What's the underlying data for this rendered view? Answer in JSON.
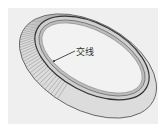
{
  "figure": {
    "annotation": "交线",
    "annotation_meaning": "intersection line",
    "colors": {
      "background": "#efefef",
      "surface": "#d6d6d6",
      "edge": "#3a3a3a",
      "hatch": "#7a7a7a"
    }
  }
}
